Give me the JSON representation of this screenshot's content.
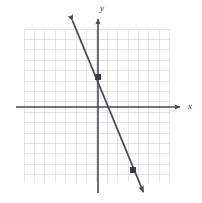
{
  "figure": {
    "width": 202,
    "height": 203,
    "background_color": "#ffffff"
  },
  "axes": {
    "x_label": "x",
    "y_label": "y",
    "axis_color": "#4a4a52",
    "origin_px": {
      "x": 98,
      "y": 107
    },
    "x_axis_y_px": 107,
    "y_axis_x_px": 98,
    "x_axis_start_px": 16,
    "x_axis_end_px": 182,
    "y_axis_start_px": 17,
    "y_axis_end_px": 193,
    "arrowheads": [
      "x-positive",
      "y-positive"
    ]
  },
  "grid": {
    "color": "#d8d8dc",
    "cell_size_px": 10.4,
    "left_px": 24,
    "top_px": 29,
    "right_px": 170,
    "bottom_px": 182,
    "columns": 14,
    "rows": 15,
    "visible": true
  },
  "chart_data": {
    "type": "line",
    "xlabel": "x",
    "ylabel": "y",
    "grid": true,
    "legend": "none",
    "xlim": [
      -7,
      7
    ],
    "ylim": [
      -7,
      8
    ],
    "xticks": [
      -7,
      -6,
      -5,
      -4,
      -3,
      -2,
      -1,
      0,
      1,
      2,
      3,
      4,
      5,
      6,
      7
    ],
    "yticks": [
      -7,
      -6,
      -5,
      -4,
      -3,
      -2,
      -1,
      0,
      1,
      2,
      3,
      4,
      5,
      6,
      7,
      8
    ],
    "tick_labels_shown": false,
    "series": [
      {
        "name": "graphed-line",
        "kind": "straight-line",
        "color": "#4a4a52",
        "slope": -2.5,
        "y_intercept": 3,
        "equation": "y = -5/2 x + 3",
        "arrows_both_ends": true,
        "x": [
          -2.6,
          4.5
        ],
        "values": [
          9.5,
          -8.3
        ],
        "endpoints_px": [
          {
            "x": 71,
            "y": 17
          },
          {
            "x": 145,
            "y": 196
          }
        ],
        "marked_points": [
          {
            "label": "(0, 3)",
            "x": 0,
            "y": 3,
            "px": {
              "x": 98,
              "y": 77
            }
          },
          {
            "label": "(3.4, -6)",
            "x": 3.4,
            "y": -6,
            "px": {
              "x": 133,
              "y": 170
            }
          }
        ]
      }
    ]
  }
}
